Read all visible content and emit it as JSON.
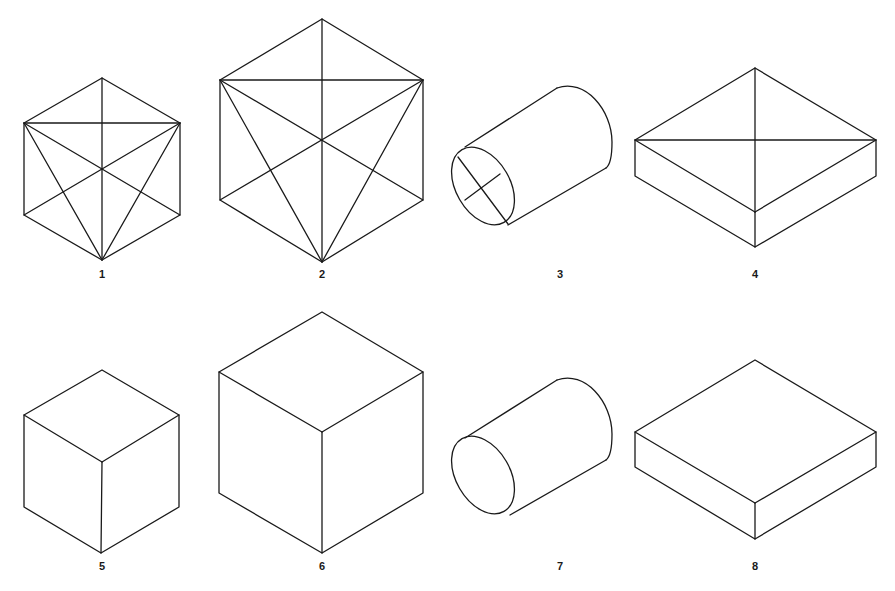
{
  "figures": [
    {
      "label": "1",
      "shape": "cube-with-diagonals",
      "size": "small"
    },
    {
      "label": "2",
      "shape": "cube-with-diagonals",
      "size": "large"
    },
    {
      "label": "3",
      "shape": "cylinder-with-center-lines",
      "size": "medium"
    },
    {
      "label": "4",
      "shape": "flat-box-with-top-diagonals",
      "size": "medium"
    },
    {
      "label": "5",
      "shape": "cube",
      "size": "small"
    },
    {
      "label": "6",
      "shape": "cube",
      "size": "large"
    },
    {
      "label": "7",
      "shape": "cylinder",
      "size": "medium"
    },
    {
      "label": "8",
      "shape": "flat-box",
      "size": "medium"
    }
  ],
  "colors": {
    "line": "#1a1a1a",
    "background": "#ffffff"
  }
}
